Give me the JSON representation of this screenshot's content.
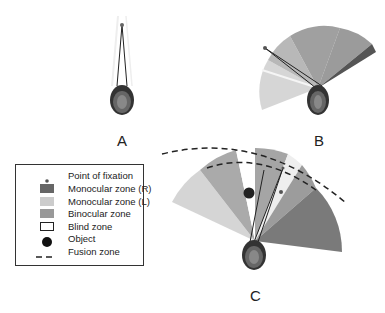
{
  "panels": [
    {
      "id": "A",
      "label": "A"
    },
    {
      "id": "B",
      "label": "B"
    },
    {
      "id": "C",
      "label": "C"
    }
  ],
  "legend": {
    "items": [
      {
        "symbol": "dot",
        "label": "Point of fixation",
        "color": "#555555"
      },
      {
        "symbol": "swatch",
        "label": "Monocular zone (R)",
        "color": "#666666"
      },
      {
        "symbol": "swatch",
        "label": "Monocular zone (L)",
        "color": "#cccccc"
      },
      {
        "symbol": "swatch",
        "label": "Binocular zone",
        "color": "#999999"
      },
      {
        "symbol": "outline",
        "label": "Blind zone",
        "color": "#ffffff"
      },
      {
        "symbol": "circle",
        "label": "Object",
        "color": "#111111"
      },
      {
        "symbol": "dash",
        "label": "Fusion zone",
        "color": "#222222"
      }
    ]
  },
  "colors": {
    "monocular_r": "#666666",
    "monocular_l": "#cccccc",
    "binocular": "#999999",
    "blind": "#ffffff",
    "line": "#222222"
  }
}
